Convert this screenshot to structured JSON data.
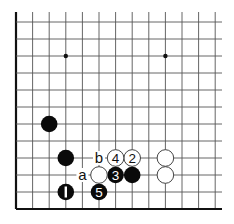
{
  "diagram": {
    "type": "go-board-corner",
    "grid": {
      "columns": 13,
      "rows": 12,
      "origin_x": 16,
      "origin_y": 22,
      "spacing_x": 16.6,
      "spacing_y": 17,
      "top_extend": 12,
      "right_extend": 222,
      "left_edge": true,
      "bottom_edge": true
    },
    "hoshi": [
      {
        "col": 3,
        "row": 2
      },
      {
        "col": 9,
        "row": 2
      }
    ],
    "stones": [
      {
        "color": "black",
        "col": 2,
        "row": 6,
        "label": ""
      },
      {
        "color": "black",
        "col": 3,
        "row": 8,
        "label": ""
      },
      {
        "color": "black",
        "col": 3,
        "row": 10,
        "label": "1"
      },
      {
        "color": "white",
        "col": 7,
        "row": 8,
        "label": "2"
      },
      {
        "color": "black",
        "col": 6,
        "row": 9,
        "label": "3"
      },
      {
        "color": "white",
        "col": 6,
        "row": 8,
        "label": "4"
      },
      {
        "color": "black",
        "col": 5,
        "row": 10,
        "label": "5"
      },
      {
        "color": "white",
        "col": 5,
        "row": 9,
        "label": ""
      },
      {
        "color": "black",
        "col": 7,
        "row": 9,
        "label": ""
      },
      {
        "color": "white",
        "col": 9,
        "row": 8,
        "label": ""
      },
      {
        "color": "white",
        "col": 9,
        "row": 9,
        "label": ""
      }
    ],
    "marks": [
      {
        "col": 5,
        "row": 8,
        "text": "b"
      },
      {
        "col": 4,
        "row": 9,
        "text": "a"
      }
    ],
    "colors": {
      "line": "#555555",
      "edge": "#111111",
      "black_stone": "#0a0a0a",
      "white_stone": "#ffffff",
      "white_stroke": "#444444"
    }
  }
}
